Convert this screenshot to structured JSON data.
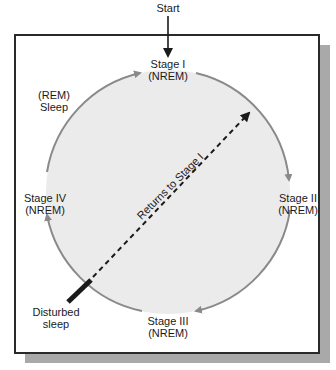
{
  "diagram": {
    "start_label": "Start",
    "stages": [
      {
        "name": "Stage I",
        "type": "(NREM)"
      },
      {
        "name": "Stage II",
        "type": "(NREM)"
      },
      {
        "name": "Stage III",
        "type": "(NREM)"
      },
      {
        "name": "Stage IV",
        "type": "(NREM)"
      }
    ],
    "rem_label": {
      "line1": "(REM)",
      "line2": "Sleep"
    },
    "disturbed_label": {
      "line1": "Disturbed",
      "line2": "sleep"
    },
    "return_label": "Returns to Stage I",
    "cycle_order": [
      "Stage I",
      "Stage II",
      "Stage III",
      "Stage IV",
      "(REM) Sleep",
      "Stage I"
    ],
    "colors": {
      "circle_fill": "#ebebeb",
      "circle_stroke": "#8a8a8a",
      "frame_border": "#2a2a2a",
      "shadow": "#a9a9a9",
      "dashed_line": "#1a1a1a"
    }
  }
}
